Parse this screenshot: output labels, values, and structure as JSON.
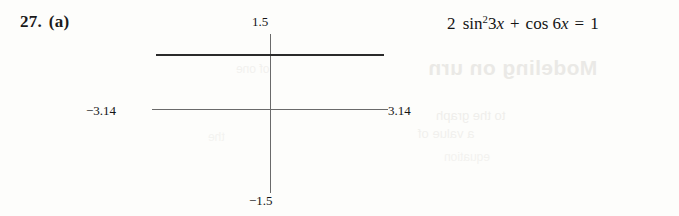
{
  "exercise": {
    "number": "27.",
    "part": "(a)"
  },
  "equation": {
    "full_text": "2 sin²3x + cos 6x = 1",
    "coefficient": "2",
    "sin_function": "sin",
    "sin_power": "2",
    "sin_argument_coefficient": "3",
    "sin_argument_variable": "x",
    "plus_operator": "+",
    "cos_function": "cos",
    "cos_argument_coefficient": "6",
    "cos_argument_variable": "x",
    "equals_operator": "=",
    "right_hand_side": "1"
  },
  "calculator_screen": {
    "window": {
      "y_max_label": "1.5",
      "y_min_label": "−1.5",
      "x_min_label": "−3.14",
      "x_max_label": "3.14"
    },
    "curve_description": "horizontal line at y = 1",
    "border_color": "#585858",
    "axis_color": "#6a6a6a",
    "curve_color": "#2a2a2a"
  },
  "background_bleed": {
    "heading": "Modeling on urn",
    "line_1": "to the graph",
    "line_2": "a value of",
    "line_3": "equation",
    "graph_ghost_1": "of one",
    "graph_ghost_2": "the"
  },
  "page": {
    "background_color": "#fdfdfb",
    "text_color": "#141414"
  }
}
